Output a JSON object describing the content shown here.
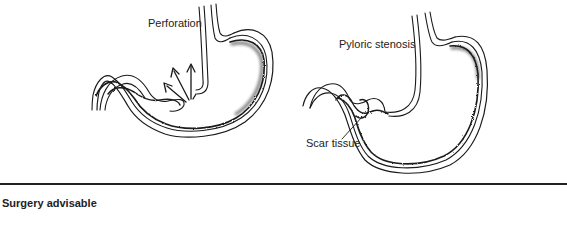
{
  "figure": {
    "left_panel": {
      "title": "Perforation",
      "illustration": "stomach-perforation"
    },
    "right_panel": {
      "title": "Pyloric stenosis",
      "annotation": "Scar tissue",
      "illustration": "stomach-pyloric-stenosis"
    }
  },
  "section": {
    "heading": "Surgery advisable"
  },
  "colors": {
    "ink": "#1a1a1a",
    "background": "#ffffff"
  }
}
